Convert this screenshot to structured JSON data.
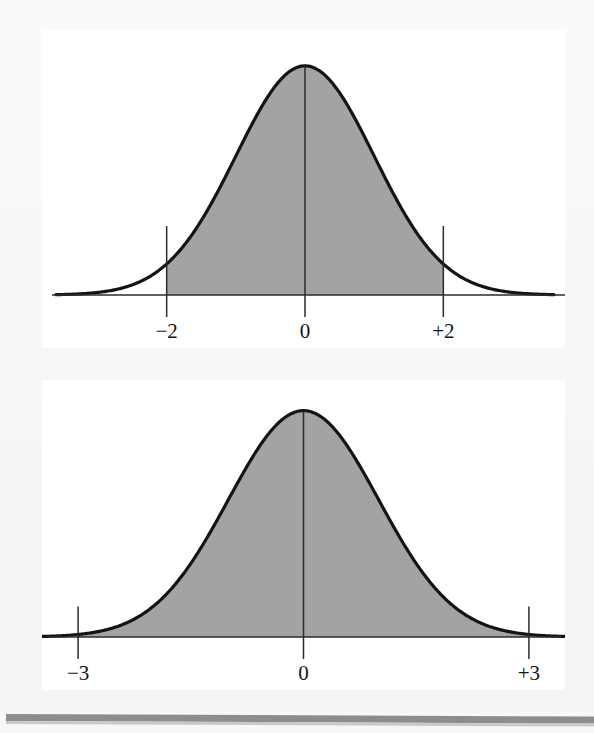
{
  "figure": {
    "kind": "statistics-textbook-figure",
    "background_color": "#f7f7f7",
    "panel_color": "#ffffff",
    "curve_color": "#141414",
    "shade_color": "#a3a3a3",
    "rule_color": "#8d8d8d",
    "panels": [
      {
        "name": "two-sigma-panel",
        "label_top": "",
        "caption": ""
      },
      {
        "name": "three-sigma-panel",
        "label_top": "",
        "caption": ""
      }
    ]
  },
  "chart_data": [
    {
      "type": "area",
      "name": "normal-curve-two-sigma",
      "title": "",
      "subtitle": "",
      "xlabel": "",
      "ylabel": "",
      "distribution": "standard normal",
      "mean": 0,
      "sd": 1,
      "xlim": [
        -3.6,
        3.6
      ],
      "ylim": [
        0,
        0.43
      ],
      "grid": false,
      "legend": null,
      "shaded_interval": [
        -2,
        2
      ],
      "shaded_label": "",
      "tick_values": [
        -2,
        0,
        2
      ],
      "tick_labels": [
        "−2",
        "0",
        "+2"
      ],
      "vertical_rules": [
        {
          "x": -2,
          "label": "−2",
          "style": "plain"
        },
        {
          "x": 0,
          "label": "0",
          "style": "center-axis"
        },
        {
          "x": 2,
          "label": "+2",
          "style": "plain"
        }
      ],
      "x": [
        -3.6,
        -3.2,
        -2.8,
        -2.4,
        -2.0,
        -1.6,
        -1.2,
        -0.8,
        -0.4,
        0.0,
        0.4,
        0.8,
        1.2,
        1.6,
        2.0,
        2.4,
        2.8,
        3.2,
        3.6
      ],
      "y": [
        0.0006,
        0.0024,
        0.0079,
        0.0224,
        0.054,
        0.1109,
        0.1942,
        0.2897,
        0.3683,
        0.3989,
        0.3683,
        0.2897,
        0.1942,
        0.1109,
        0.054,
        0.0224,
        0.0079,
        0.0024,
        0.0006
      ]
    },
    {
      "type": "area",
      "name": "normal-curve-three-sigma",
      "title": "",
      "subtitle": "",
      "xlabel": "",
      "ylabel": "",
      "distribution": "standard normal",
      "mean": 0,
      "sd": 1,
      "xlim": [
        -3.6,
        3.6
      ],
      "ylim": [
        0,
        0.43
      ],
      "grid": false,
      "legend": null,
      "shaded_interval": [
        -3,
        3
      ],
      "shaded_label": "",
      "tick_values": [
        -3,
        0,
        3
      ],
      "tick_labels": [
        "−3",
        "0",
        "+3"
      ],
      "vertical_rules": [
        {
          "x": -3,
          "label": "−3",
          "style": "plain"
        },
        {
          "x": 0,
          "label": "0",
          "style": "center-axis"
        },
        {
          "x": 3,
          "label": "+3",
          "style": "plain"
        }
      ],
      "x": [
        -3.6,
        -3.2,
        -2.8,
        -2.4,
        -2.0,
        -1.6,
        -1.2,
        -0.8,
        -0.4,
        0.0,
        0.4,
        0.8,
        1.2,
        1.6,
        2.0,
        2.4,
        2.8,
        3.2,
        3.6
      ],
      "y": [
        0.0006,
        0.0024,
        0.0079,
        0.0224,
        0.054,
        0.1109,
        0.1942,
        0.2897,
        0.3683,
        0.3989,
        0.3683,
        0.2897,
        0.1942,
        0.1109,
        0.054,
        0.0224,
        0.0079,
        0.0024,
        0.0006
      ]
    }
  ],
  "labels": {
    "top": {
      "left": "−2",
      "center": "0",
      "right": "+2"
    },
    "bottom": {
      "left": "−3",
      "center": "0",
      "right": "+3"
    }
  }
}
